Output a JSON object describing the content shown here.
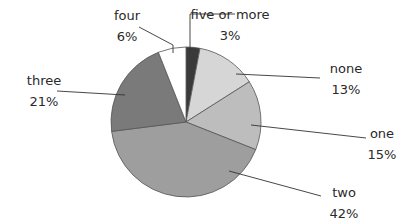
{
  "chart_data": {
    "type": "pie",
    "title": "",
    "center": [
      186,
      122
    ],
    "radius": 75,
    "slices": [
      {
        "label": "five or more",
        "value": 3,
        "pct": "3%",
        "color": "#3a3a3a"
      },
      {
        "label": "none",
        "value": 13,
        "pct": "13%",
        "color": "#d6d6d6"
      },
      {
        "label": "one",
        "value": 15,
        "pct": "15%",
        "color": "#bdbdbd"
      },
      {
        "label": "two",
        "value": 42,
        "pct": "42%",
        "color": "#9e9e9e"
      },
      {
        "label": "three",
        "value": 21,
        "pct": "21%",
        "color": "#7a7a7a"
      },
      {
        "label": "four",
        "value": 6,
        "pct": "6%",
        "color": "#ffffff"
      }
    ],
    "labels": [
      {
        "name": "five or more",
        "pct": "3%",
        "x": 230,
        "y": 4,
        "lx1": 190,
        "ly1": 50,
        "lx2": 190,
        "ly2": 14,
        "lx3": 235,
        "ly3": 14
      },
      {
        "name": "none",
        "pct": "13%",
        "x": 346,
        "y": 58,
        "lx1": 236,
        "ly1": 74,
        "lx2": 320,
        "ly2": 78
      },
      {
        "name": "one",
        "pct": "15%",
        "x": 382,
        "y": 123,
        "lx1": 251,
        "ly1": 125,
        "lx2": 366,
        "ly2": 138
      },
      {
        "name": "two",
        "pct": "42%",
        "x": 344,
        "y": 182,
        "lx1": 229,
        "ly1": 171,
        "lx2": 321,
        "ly2": 196
      },
      {
        "name": "three",
        "pct": "21%",
        "x": 44,
        "y": 70,
        "lx1": 57,
        "ly1": 91,
        "lx2": 125,
        "ly2": 95
      },
      {
        "name": "four",
        "pct": "6%",
        "x": 127,
        "y": 5,
        "lx1": 139,
        "ly1": 27,
        "lx2": 173,
        "ly2": 45,
        "lx3": 173,
        "ly3": 53
      }
    ]
  }
}
